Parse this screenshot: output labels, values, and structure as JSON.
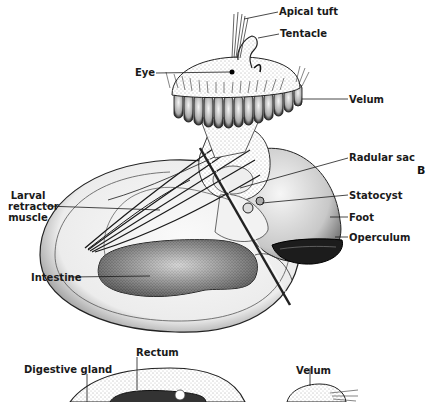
{
  "figure": {
    "panel_letter": "B",
    "labels": {
      "apical_tuft": "Apical tuft",
      "tentacle": "Tentacle",
      "eye": "Eye",
      "velum": "Velum",
      "radular_sac": "Radular sac",
      "larval_retractor_muscle_1": "Larval",
      "larval_retractor_muscle_2": "retractor",
      "larval_retractor_muscle_3": "muscle",
      "statocyst": "Statocyst",
      "foot": "Foot",
      "operculum": "Operculum",
      "intestine": "Intestine",
      "digestive_gland": "Digestive gland",
      "rectum": "Rectum",
      "velum_lower": "Velum"
    }
  }
}
